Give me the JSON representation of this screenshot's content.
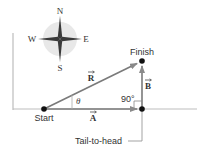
{
  "compass": {
    "north": "N",
    "south": "S",
    "east": "E",
    "west": "W",
    "icon": "compass-rose-icon"
  },
  "points": {
    "start": "Start",
    "finish": "Finish"
  },
  "vectors": {
    "a": {
      "label": "A",
      "direction": "east"
    },
    "b": {
      "label": "B",
      "direction": "north"
    },
    "r": {
      "label": "R",
      "direction": "resultant"
    }
  },
  "angle_label": "θ",
  "right_angle_label": "90°",
  "callout": "Tail-to-head",
  "colors": {
    "vector": "#7a7a7a",
    "axis": "#bdbdbd",
    "point": "#111111",
    "text": "#333333",
    "compass_disc": "#e6e6e6"
  }
}
